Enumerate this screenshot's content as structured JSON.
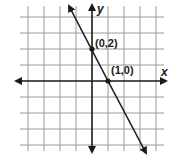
{
  "chart_data": {
    "type": "line",
    "title": "",
    "xlabel": "x",
    "ylabel": "y",
    "xlim": [
      -5,
      4
    ],
    "ylim": [
      -4,
      5
    ],
    "grid": true,
    "series": [
      {
        "name": "y = -2x + 2",
        "slope": -2,
        "intercept": 2,
        "x": [
          -1.4,
          3.3
        ],
        "y": [
          4.8,
          -4.6
        ]
      }
    ],
    "points": [
      {
        "x": 0,
        "y": 2,
        "label": "(0,2)"
      },
      {
        "x": 1,
        "y": 0,
        "label": "(1,0)"
      }
    ],
    "colors": {
      "line": "#1a1a1a",
      "grid": "#9a9a9a"
    }
  },
  "labels": {
    "x_axis": "x",
    "y_axis": "y",
    "point_a": "(0,2)",
    "point_b": "(1,0)"
  }
}
